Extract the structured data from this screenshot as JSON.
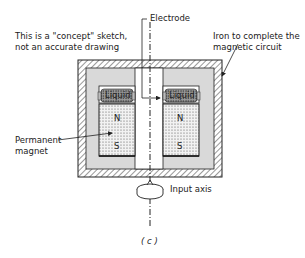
{
  "labels": {
    "note_line1": "This is a \"concept\" sketch,",
    "note_line2": "not an accurate drawing",
    "electrode": "Electrode",
    "iron_line1": "Iron to complete the",
    "iron_line2": "magnetic circuit",
    "magnet_line1": "Permanent",
    "magnet_line2": "magnet",
    "liquid_left": "Liquid",
    "liquid_right": "Liquid",
    "north_left": "N",
    "south_left": "S",
    "north_right": "N",
    "south_right": "S",
    "input_axis": "Input axis",
    "caption": "( c )"
  },
  "colors": {
    "outline": "#222222",
    "iron_fill": "#d9d9d9",
    "magnet_fill": "#e6e6e6",
    "liquid_fill": "#9a9a9a",
    "background": "#ffffff"
  }
}
